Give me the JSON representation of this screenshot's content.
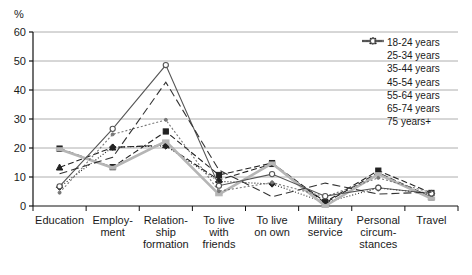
{
  "chart_data": {
    "type": "line",
    "title": "",
    "xlabel": "",
    "ylabel": "%",
    "ylim": [
      0,
      60
    ],
    "yticks": [
      0,
      10,
      20,
      30,
      40,
      50,
      60
    ],
    "grid": true,
    "legend_position": "top-right",
    "categories": [
      "Education",
      "Employ-\nment",
      "Relation-\nship\nformation",
      "To live\nwith\nfriends",
      "To live\non own",
      "Military\nservice",
      "Personal\ncircum-\nstances",
      "Travel"
    ],
    "categories_plain": [
      "Education",
      "Employment",
      "Relationship formation",
      "To live with friends",
      "To live on own",
      "Military service",
      "Personal circumstances",
      "Travel"
    ],
    "series": [
      {
        "name": "18-24 years",
        "marker": "diamond",
        "dash": "1,2",
        "color": "#222222",
        "values": [
          6.5,
          20.3,
          20.7,
          8.5,
          7.6,
          1.2,
          6.2,
          4.3
        ]
      },
      {
        "name": "25-34 years",
        "marker": "square",
        "dash": "6,3",
        "color": "#222222",
        "values": [
          19.8,
          13.4,
          25.7,
          10.7,
          14.8,
          1.4,
          12.2,
          4.5
        ]
      },
      {
        "name": "35-44 years",
        "marker": "triangle",
        "dash": "6,3",
        "color": "#222222",
        "values": [
          13.3,
          20.2,
          21.0,
          9.0,
          14.5,
          1.1,
          11.5,
          3.0
        ]
      },
      {
        "name": "45-54 years",
        "marker": "bar",
        "dash": "none",
        "color": "#b5b5b5",
        "values": [
          19.6,
          13.2,
          22.3,
          4.0,
          14.7,
          0.0,
          11.0,
          2.6
        ]
      },
      {
        "name": "55-64 years",
        "marker": "dot",
        "dash": "2,2",
        "color": "#777777",
        "values": [
          4.6,
          24.7,
          29.7,
          5.1,
          8.1,
          3.2,
          9.7,
          4.6
        ]
      },
      {
        "name": "65-74 years",
        "marker": "circle",
        "dash": "none",
        "color": "#555555",
        "values": [
          6.8,
          26.6,
          48.6,
          7.0,
          11.0,
          3.4,
          6.3,
          4.3
        ]
      },
      {
        "name": "75 years+",
        "marker": "none",
        "dash": "8,4",
        "color": "#333333",
        "values": [
          11.1,
          16.8,
          42.7,
          12.4,
          3.2,
          7.9,
          4.1,
          4.8
        ]
      }
    ]
  },
  "axis": {
    "unit_label": "%",
    "y_tick_labels": [
      "60",
      "50",
      "40",
      "30",
      "20",
      "10",
      "0"
    ]
  },
  "legend": {
    "items": [
      "18-24 years",
      "25-34 years",
      "35-44 years",
      "45-54 years",
      "55-64 years",
      "65-74 years",
      "75 years+"
    ]
  }
}
